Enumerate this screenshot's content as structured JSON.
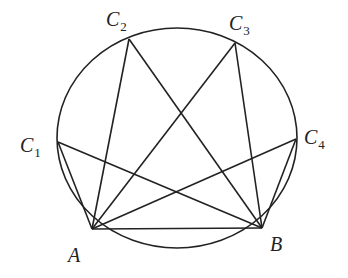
{
  "diagram": {
    "type": "geometry",
    "circle": {
      "cx": 177,
      "cy": 138,
      "rx": 120,
      "ry": 110
    },
    "points": {
      "A": {
        "x": 92,
        "y": 229,
        "label": "A",
        "sub": ""
      },
      "B": {
        "x": 262,
        "y": 228,
        "label": "B",
        "sub": ""
      },
      "C1": {
        "x": 58,
        "y": 142,
        "label": "C",
        "sub": "1"
      },
      "C2": {
        "x": 129,
        "y": 39,
        "label": "C",
        "sub": "2"
      },
      "C3": {
        "x": 235,
        "y": 43,
        "label": "C",
        "sub": "3"
      },
      "C4": {
        "x": 296,
        "y": 139,
        "label": "C",
        "sub": "4"
      }
    },
    "segments": [
      [
        "A",
        "B"
      ],
      [
        "A",
        "C1"
      ],
      [
        "B",
        "C1"
      ],
      [
        "A",
        "C2"
      ],
      [
        "B",
        "C2"
      ],
      [
        "A",
        "C3"
      ],
      [
        "B",
        "C3"
      ],
      [
        "A",
        "C4"
      ],
      [
        "B",
        "C4"
      ]
    ],
    "labels": {
      "A": {
        "text": "A",
        "x": 68,
        "y": 262
      },
      "B": {
        "text": "B",
        "x": 270,
        "y": 251
      },
      "C1": {
        "text": "C",
        "sub": "1",
        "x": 20,
        "y": 152
      },
      "C2": {
        "text": "C",
        "sub": "2",
        "x": 106,
        "y": 26
      },
      "C3": {
        "text": "C",
        "sub": "3",
        "x": 229,
        "y": 30
      },
      "C4": {
        "text": "C",
        "sub": "4",
        "x": 304,
        "y": 144
      }
    },
    "colors": {
      "stroke": "#222222",
      "background": "#ffffff"
    }
  }
}
